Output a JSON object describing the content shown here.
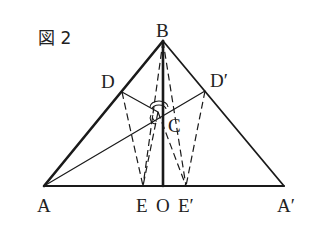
{
  "figure": {
    "title": "図 2",
    "points": {
      "A": {
        "label": "A",
        "x": 44,
        "y": 186
      },
      "A_prime": {
        "label": "A′",
        "x": 284,
        "y": 186
      },
      "B": {
        "label": "B",
        "x": 163,
        "y": 41
      },
      "O": {
        "label": "O",
        "x": 163,
        "y": 186
      },
      "E": {
        "label": "E",
        "x": 143,
        "y": 186
      },
      "E_prime": {
        "label": "E′",
        "x": 186,
        "y": 186
      },
      "D": {
        "label": "D",
        "x": 122,
        "y": 92
      },
      "D_prime": {
        "label": "D′",
        "x": 205,
        "y": 91
      },
      "C": {
        "label": "C",
        "x": 158,
        "y": 112
      }
    },
    "segments": [
      {
        "from": "A",
        "to": "B",
        "style": "thick"
      },
      {
        "from": "B",
        "to": "O",
        "style": "thick"
      },
      {
        "from": "A",
        "to": "A_prime",
        "style": "medium"
      },
      {
        "from": "B",
        "to": "A_prime",
        "style": "medium"
      },
      {
        "from": "A",
        "to": "D_prime",
        "style": "thin",
        "via": "C"
      },
      {
        "from": "D",
        "to": "C",
        "style": "thin"
      },
      {
        "from": "D",
        "to": "E",
        "style": "dashed"
      },
      {
        "from": "D_prime",
        "to": "E_prime",
        "style": "dashed"
      },
      {
        "from": "B",
        "to": "E",
        "style": "dashed"
      },
      {
        "from": "B",
        "to": "E_prime",
        "style": "dashed"
      },
      {
        "from": "C",
        "to": "E",
        "style": "dashed"
      },
      {
        "from": "C",
        "to": "E_prime",
        "style": "dashed"
      }
    ],
    "angle_marks_at": "C"
  }
}
